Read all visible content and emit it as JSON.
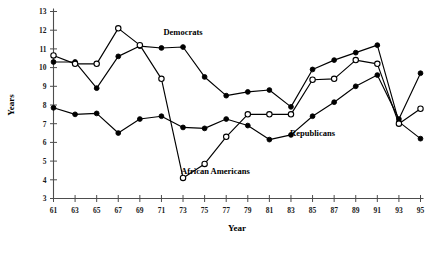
{
  "chart_data": {
    "type": "line",
    "title": "",
    "xlabel": "Year",
    "ylabel": "Years",
    "xlim": [
      61,
      95
    ],
    "ylim": [
      3,
      13
    ],
    "xticks": [
      "61",
      "63",
      "65",
      "67",
      "69",
      "71",
      "73",
      "75",
      "77",
      "79",
      "81",
      "83",
      "85",
      "87",
      "89",
      "91",
      "93",
      "95"
    ],
    "yticks": [
      "3",
      "4",
      "5",
      "6",
      "7",
      "8",
      "9",
      "10",
      "11",
      "12",
      "13"
    ],
    "grid": false,
    "legend_position": "inline-annotations",
    "x": [
      61,
      63,
      65,
      67,
      69,
      71,
      73,
      75,
      77,
      79,
      81,
      83,
      85,
      87,
      89,
      91,
      93,
      95
    ],
    "series": [
      {
        "name": "Democrats",
        "marker": "filled-circle",
        "label": "Democrats",
        "label_x": 73,
        "label_y": 11.75,
        "values": [
          10.3,
          10.3,
          8.9,
          10.6,
          11.15,
          11.05,
          11.1,
          9.5,
          8.5,
          8.7,
          8.8,
          7.9,
          9.9,
          10.4,
          10.8,
          11.2,
          7.1,
          6.2
        ]
      },
      {
        "name": "Republicans",
        "marker": "filled-circle",
        "label": "Republicans",
        "label_x": 85,
        "label_y": 6.35,
        "values": [
          7.85,
          7.5,
          7.55,
          6.5,
          7.25,
          7.4,
          6.8,
          6.75,
          7.25,
          6.9,
          6.15,
          6.4,
          7.4,
          8.15,
          9.0,
          9.6,
          7.25,
          9.7
        ]
      },
      {
        "name": "African Americans",
        "marker": "open-circle",
        "label": "African Americans",
        "label_x": 76,
        "label_y": 4.3,
        "values": [
          10.65,
          10.2,
          10.2,
          12.1,
          11.2,
          9.4,
          4.1,
          4.85,
          6.3,
          7.5,
          7.5,
          7.5,
          9.35,
          9.4,
          10.4,
          10.2,
          7.0,
          7.8
        ]
      }
    ]
  },
  "annotations": {
    "democrats": "Democrats",
    "republicans": "Republicans",
    "african_americans": "African Americans"
  },
  "axes": {
    "x_title": "Year",
    "y_title": "Years"
  },
  "colors": {
    "line": "#000000",
    "axis": "#4d4d4d",
    "background": "#ffffff"
  }
}
